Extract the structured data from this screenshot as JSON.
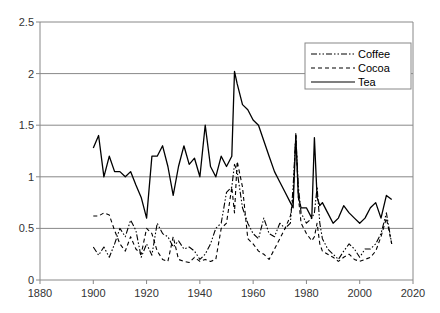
{
  "chart_data": {
    "type": "line",
    "title": "",
    "xlabel": "",
    "ylabel": "",
    "xlim": [
      1880,
      2020
    ],
    "ylim": [
      0,
      2.5
    ],
    "x_ticks": [
      "1880",
      "1900",
      "1920",
      "1940",
      "1960",
      "1980",
      "2000",
      "2020"
    ],
    "y_ticks": [
      "0",
      "0.5",
      "1",
      "1.5",
      "2",
      "2.5"
    ],
    "grid": "horizontal",
    "legend_position": "upper right",
    "x": [
      1900,
      1902,
      1904,
      1906,
      1908,
      1910,
      1912,
      1914,
      1916,
      1918,
      1920,
      1922,
      1924,
      1926,
      1928,
      1930,
      1932,
      1934,
      1936,
      1938,
      1940,
      1942,
      1944,
      1946,
      1948,
      1950,
      1952,
      1953,
      1954,
      1956,
      1958,
      1960,
      1962,
      1964,
      1966,
      1968,
      1970,
      1972,
      1974,
      1975,
      1976,
      1977,
      1978,
      1980,
      1982,
      1983,
      1984,
      1985,
      1986,
      1988,
      1990,
      1992,
      1994,
      1996,
      1998,
      2000,
      2002,
      2004,
      2006,
      2008,
      2010,
      2012
    ],
    "series": [
      {
        "name": "Coffee",
        "style": "dash-dot-dot",
        "values": [
          0.32,
          0.24,
          0.32,
          0.22,
          0.35,
          0.5,
          0.42,
          0.58,
          0.48,
          0.22,
          0.35,
          0.24,
          0.55,
          0.45,
          0.42,
          0.32,
          0.38,
          0.3,
          0.32,
          0.28,
          0.2,
          0.25,
          0.35,
          0.5,
          0.55,
          0.85,
          0.9,
          1.12,
          1.05,
          0.7,
          0.55,
          0.45,
          0.4,
          0.6,
          0.45,
          0.42,
          0.55,
          0.5,
          0.55,
          0.9,
          1.4,
          0.9,
          0.65,
          0.55,
          0.6,
          0.65,
          0.9,
          0.55,
          0.4,
          0.3,
          0.25,
          0.2,
          0.28,
          0.35,
          0.3,
          0.22,
          0.3,
          0.3,
          0.35,
          0.45,
          0.65,
          0.35
        ]
      },
      {
        "name": "Cocoa",
        "style": "dashed",
        "values": [
          0.62,
          0.62,
          0.65,
          0.63,
          0.48,
          0.35,
          0.28,
          0.42,
          0.3,
          0.25,
          0.5,
          0.45,
          0.28,
          0.2,
          0.18,
          0.42,
          0.2,
          0.18,
          0.17,
          0.22,
          0.18,
          0.2,
          0.18,
          0.2,
          0.5,
          0.55,
          0.9,
          0.65,
          1.15,
          0.9,
          0.4,
          0.35,
          0.28,
          0.25,
          0.2,
          0.3,
          0.4,
          0.5,
          0.62,
          0.8,
          1.42,
          0.8,
          0.55,
          0.45,
          0.38,
          0.42,
          0.55,
          0.35,
          0.28,
          0.25,
          0.22,
          0.18,
          0.22,
          0.25,
          0.2,
          0.18,
          0.2,
          0.22,
          0.28,
          0.42,
          0.6,
          0.35
        ]
      },
      {
        "name": "Tea",
        "style": "solid",
        "values": [
          1.28,
          1.4,
          1.0,
          1.2,
          1.05,
          1.05,
          1.0,
          1.05,
          0.92,
          0.8,
          0.6,
          1.2,
          1.2,
          1.3,
          1.1,
          0.82,
          1.1,
          1.3,
          1.12,
          1.18,
          1.0,
          1.5,
          1.1,
          1.0,
          1.2,
          1.1,
          1.2,
          2.02,
          1.9,
          1.7,
          1.65,
          1.55,
          1.5,
          1.35,
          1.2,
          1.05,
          0.95,
          0.85,
          0.75,
          0.7,
          1.4,
          0.8,
          0.7,
          0.7,
          0.6,
          1.38,
          0.8,
          0.72,
          0.75,
          0.65,
          0.55,
          0.6,
          0.72,
          0.65,
          0.6,
          0.55,
          0.6,
          0.7,
          0.75,
          0.6,
          0.82,
          0.78
        ]
      }
    ]
  },
  "legend": {
    "items": [
      {
        "label": "Coffee",
        "dash": "6,2,1.5,2,1.5,2"
      },
      {
        "label": "Cocoa",
        "dash": "4,3"
      },
      {
        "label": "Tea",
        "dash": ""
      }
    ]
  },
  "colors": {
    "line": "#000000",
    "grid": "#888888",
    "axis": "#888888",
    "text": "#333333",
    "background": "#ffffff"
  }
}
